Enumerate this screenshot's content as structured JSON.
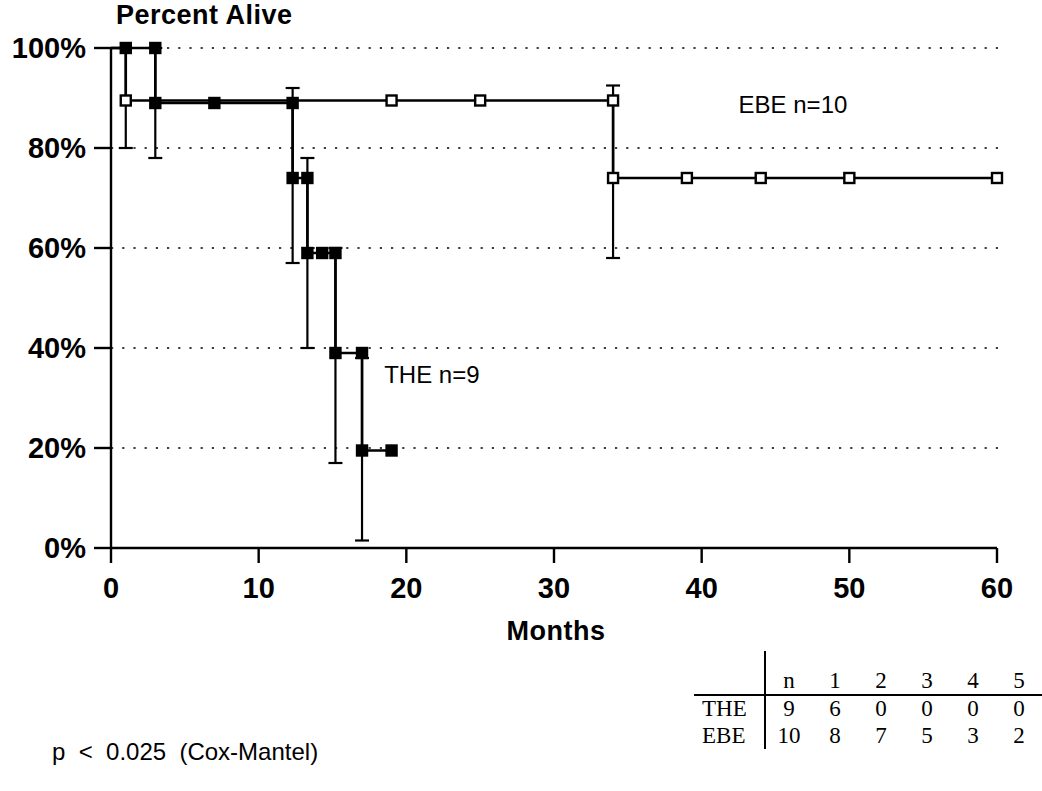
{
  "chart_data": {
    "type": "line",
    "title": "Percent Alive",
    "xlabel": "Months",
    "ylabel": "Percent Alive",
    "xlim": [
      0,
      60
    ],
    "ylim": [
      0,
      100
    ],
    "xticks": [
      "0",
      "10",
      "20",
      "30",
      "40",
      "50",
      "60"
    ],
    "xtick_values": [
      0,
      10,
      20,
      30,
      40,
      50,
      60
    ],
    "yticks": [
      "0%",
      "20%",
      "40%",
      "60%",
      "80%",
      "100%"
    ],
    "ytick_values": [
      0,
      20,
      40,
      60,
      80,
      100
    ],
    "grid": "horizontal-dotted",
    "legend_position": "in-plot",
    "annotations": [
      {
        "text": "p  <  0.025  (Cox-Mantel)",
        "location": "below-axis-left"
      }
    ],
    "series": [
      {
        "name": "EBE",
        "label": "EBE   n=10",
        "n": 10,
        "marker": "open-square",
        "label_x": 42.5,
        "label_y": 87,
        "steps": [
          {
            "x": 0,
            "y": 100
          },
          {
            "x": 1,
            "y": 100
          },
          {
            "x": 1,
            "y": 89.5
          },
          {
            "x": 34,
            "y": 89.5
          },
          {
            "x": 34,
            "y": 74
          },
          {
            "x": 60,
            "y": 74
          }
        ],
        "censored": [
          {
            "x": 1,
            "y": 89.5
          },
          {
            "x": 19,
            "y": 89.5
          },
          {
            "x": 25,
            "y": 89.5
          },
          {
            "x": 34,
            "y": 89.5
          },
          {
            "x": 34,
            "y": 74
          },
          {
            "x": 39,
            "y": 74
          },
          {
            "x": 44,
            "y": 74
          },
          {
            "x": 50,
            "y": 74
          },
          {
            "x": 60,
            "y": 74
          }
        ],
        "error_bars": [
          {
            "x": 1,
            "y": 89.5,
            "low": 80,
            "high": 100
          },
          {
            "x": 34,
            "y": 89.5,
            "low": 58,
            "high": 92.5
          }
        ]
      },
      {
        "name": "THE",
        "label": "THE   n=9",
        "n": 9,
        "marker": "filled-square",
        "label_x": 18.5,
        "label_y": 33,
        "steps": [
          {
            "x": 0,
            "y": 100
          },
          {
            "x": 3,
            "y": 100
          },
          {
            "x": 3,
            "y": 89
          },
          {
            "x": 12.3,
            "y": 89
          },
          {
            "x": 12.3,
            "y": 74
          },
          {
            "x": 13.3,
            "y": 74
          },
          {
            "x": 13.3,
            "y": 59
          },
          {
            "x": 15.2,
            "y": 59
          },
          {
            "x": 15.2,
            "y": 39
          },
          {
            "x": 17,
            "y": 39
          },
          {
            "x": 17,
            "y": 19.5
          },
          {
            "x": 19,
            "y": 19.5
          }
        ],
        "censored": [
          {
            "x": 1,
            "y": 100
          },
          {
            "x": 3,
            "y": 100
          },
          {
            "x": 3,
            "y": 89
          },
          {
            "x": 7,
            "y": 89
          },
          {
            "x": 12.3,
            "y": 89
          },
          {
            "x": 12.3,
            "y": 74
          },
          {
            "x": 13.3,
            "y": 74
          },
          {
            "x": 13.3,
            "y": 59
          },
          {
            "x": 14.3,
            "y": 59
          },
          {
            "x": 15.2,
            "y": 59
          },
          {
            "x": 15.2,
            "y": 39
          },
          {
            "x": 17,
            "y": 39
          },
          {
            "x": 17,
            "y": 19.5
          },
          {
            "x": 19,
            "y": 19.5
          }
        ],
        "error_bars": [
          {
            "x": 3,
            "y": 89,
            "low": 78,
            "high": 100
          },
          {
            "x": 12.3,
            "y": 74,
            "low": 57,
            "high": 92
          },
          {
            "x": 13.3,
            "y": 59,
            "low": 40,
            "high": 78
          },
          {
            "x": 15.2,
            "y": 39,
            "low": 17,
            "high": 60
          },
          {
            "x": 17,
            "y": 19.5,
            "low": 1.5,
            "high": 38
          }
        ]
      }
    ]
  },
  "risk_table": {
    "corner": "",
    "columns": [
      "n",
      "1",
      "2",
      "3",
      "4",
      "5"
    ],
    "rows": [
      {
        "label": "THE",
        "values": [
          "9",
          "6",
          "0",
          "0",
          "0",
          "0"
        ]
      },
      {
        "label": "EBE",
        "values": [
          "10",
          "8",
          "7",
          "5",
          "3",
          "2"
        ]
      }
    ]
  },
  "footnote": {
    "p_value_text": "p  <  0.025  (Cox-Mantel)"
  }
}
